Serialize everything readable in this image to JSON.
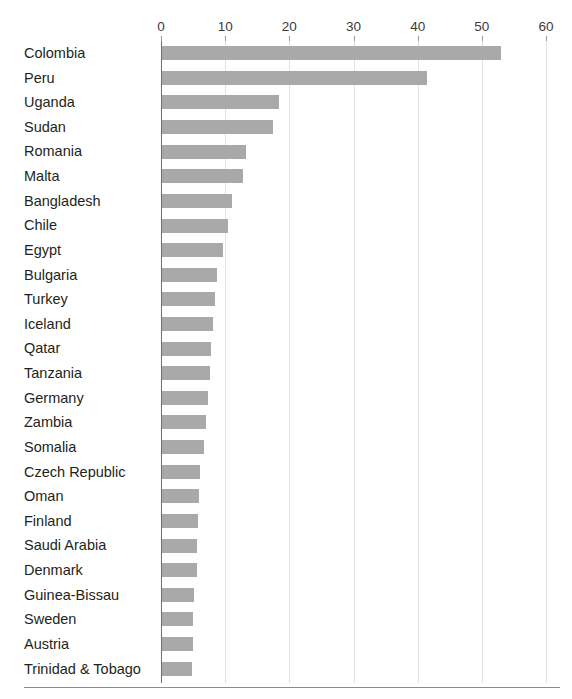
{
  "chart_data": {
    "type": "bar",
    "orientation": "horizontal",
    "title": "",
    "xlabel": "",
    "ylabel": "",
    "xlim": [
      0,
      60
    ],
    "ylim": null,
    "grid": "vertical",
    "legend": "none",
    "bar_color": "#a9a9a9",
    "axis_ticks": [
      "0",
      "10",
      "20",
      "30",
      "40",
      "50",
      "60"
    ],
    "axis_tick_values": [
      0,
      10,
      20,
      30,
      40,
      50,
      60
    ],
    "categories": [
      "Colombia",
      "Peru",
      "Uganda",
      "Sudan",
      "Romania",
      "Malta",
      "Bangladesh",
      "Chile",
      "Egypt",
      "Bulgaria",
      "Turkey",
      "Iceland",
      "Qatar",
      "Tanzania",
      "Germany",
      "Zambia",
      "Somalia",
      "Czech Republic",
      "Oman",
      "Finland",
      "Saudi Arabia",
      "Denmark",
      "Guinea-Bissau",
      "Sweden",
      "Austria",
      "Trinidad & Tobago"
    ],
    "values": [
      52.8,
      41.3,
      18.2,
      17.3,
      13.1,
      12.6,
      10.9,
      10.3,
      9.5,
      8.5,
      8.3,
      8.0,
      7.6,
      7.5,
      7.1,
      6.8,
      6.5,
      5.9,
      5.8,
      5.6,
      5.5,
      5.4,
      5.0,
      4.9,
      4.8,
      4.6
    ]
  }
}
